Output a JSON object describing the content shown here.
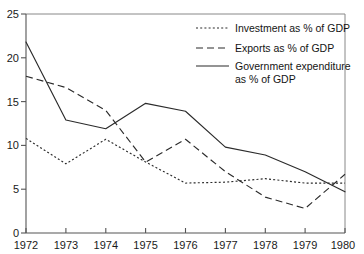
{
  "chart_data": {
    "type": "line",
    "title": "",
    "xlabel": "",
    "ylabel": "",
    "x": [
      1972,
      1973,
      1974,
      1975,
      1976,
      1977,
      1978,
      1979,
      1980
    ],
    "categories": [
      "1972",
      "1973",
      "1974",
      "1975",
      "1976",
      "1977",
      "1978",
      "1979",
      "1980"
    ],
    "xlim": [
      1972,
      1980
    ],
    "ylim": [
      0,
      25
    ],
    "yticks": [
      0,
      5,
      10,
      15,
      20,
      25
    ],
    "ytick_labels": [
      "0",
      "5",
      "10",
      "15",
      "20",
      "25"
    ],
    "xtick_labels": [
      "1972",
      "1973",
      "1974",
      "1975",
      "1976",
      "1977",
      "1978",
      "1979",
      "1980"
    ],
    "grid": false,
    "legend_position": "top-right inside plot area",
    "series": [
      {
        "name": "Investment as % of GDP",
        "style": "dotted",
        "values": [
          10.8,
          7.9,
          10.7,
          8.1,
          5.7,
          5.8,
          6.2,
          5.7,
          5.7
        ]
      },
      {
        "name": "Exports as % of GDP",
        "style": "dashed",
        "values": [
          17.9,
          16.6,
          14.0,
          8.1,
          10.7,
          7.0,
          4.1,
          2.8,
          6.7
        ]
      },
      {
        "name": "Government expenditure as % of GDP",
        "style": "solid",
        "values": [
          21.8,
          12.9,
          11.9,
          14.8,
          13.9,
          9.8,
          8.9,
          7.0,
          4.7
        ]
      }
    ]
  },
  "legend": {
    "entries": [
      {
        "label": "Investment as % of GDP",
        "style": "dotted"
      },
      {
        "label": "Exports as % of GDP",
        "style": "dashed"
      },
      {
        "label_line1": "Government expenditure",
        "label_line2": "as % of GDP",
        "style": "solid"
      }
    ]
  },
  "axes": {
    "y_tick_labels": [
      "25",
      "20",
      "15",
      "10",
      "5",
      "0"
    ],
    "x_tick_labels": [
      "1972",
      "1973",
      "1974",
      "1975",
      "1976",
      "1977",
      "1978",
      "1979",
      "1980"
    ]
  }
}
